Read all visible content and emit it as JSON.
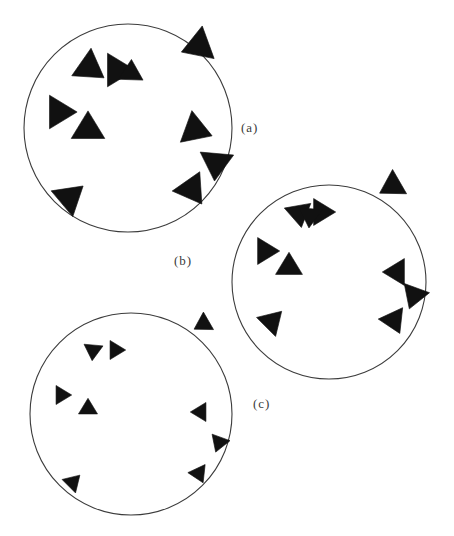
{
  "figure": {
    "title": "",
    "background_color": "#ffffff",
    "ink_color": "#111111",
    "circle_stroke_color": "#3c3c3c",
    "width": 454,
    "height": 536
  },
  "labels": {
    "panel_a": "(a)",
    "panel_b": "(b)",
    "panel_c": "(c)"
  },
  "chart_data": {
    "type": "scatter",
    "title": "",
    "xlabel": "",
    "ylabel": "",
    "panels": [
      {
        "id": "a",
        "label": "(a)",
        "circle": {
          "cx": 128,
          "cy": 128,
          "r": 104
        },
        "triangle_size": 30,
        "agent_count": 10,
        "agents": [
          {
            "x": 90,
            "y": 68,
            "heading_deg": 35,
            "size": 30
          },
          {
            "x": 118,
            "y": 70,
            "heading_deg": 0,
            "size": 30
          },
          {
            "x": 60,
            "y": 112,
            "heading_deg": 0,
            "size": 30
          },
          {
            "x": 88,
            "y": 128,
            "heading_deg": -90,
            "size": 30
          },
          {
            "x": 198,
            "y": 46,
            "heading_deg": 160,
            "size": 31
          },
          {
            "x": 196,
            "y": 130,
            "heading_deg": 20,
            "size": 30
          },
          {
            "x": 216,
            "y": 164,
            "heading_deg": 95,
            "size": 30
          },
          {
            "x": 192,
            "y": 190,
            "heading_deg": 55,
            "size": 30
          },
          {
            "x": 70,
            "y": 197,
            "heading_deg": -40,
            "size": 30
          },
          {
            "x": 131,
            "y": 72,
            "heading_deg": -88,
            "size": 22
          }
        ]
      },
      {
        "id": "b",
        "label": "(b)",
        "circle": {
          "cx": 329,
          "cy": 282,
          "r": 97
        },
        "triangle_size": 24,
        "agent_count": 10,
        "agents": [
          {
            "x": 299,
            "y": 214,
            "heading_deg": 80,
            "size": 24
          },
          {
            "x": 322,
            "y": 212,
            "heading_deg": 0,
            "size": 24
          },
          {
            "x": 266,
            "y": 251,
            "heading_deg": 0,
            "size": 24
          },
          {
            "x": 289,
            "y": 266,
            "heading_deg": -90,
            "size": 24
          },
          {
            "x": 392,
            "y": 186,
            "heading_deg": 150,
            "size": 25
          },
          {
            "x": 396,
            "y": 272,
            "heading_deg": 180,
            "size": 24
          },
          {
            "x": 414,
            "y": 296,
            "heading_deg": 110,
            "size": 24
          },
          {
            "x": 394,
            "y": 321,
            "heading_deg": 65,
            "size": 24
          },
          {
            "x": 272,
            "y": 321,
            "heading_deg": -45,
            "size": 24
          },
          {
            "x": 310,
            "y": 216,
            "heading_deg": 95,
            "size": 21
          }
        ]
      },
      {
        "id": "c",
        "label": "(c)",
        "circle": {
          "cx": 131,
          "cy": 414,
          "r": 101
        },
        "triangle_size": 17,
        "agent_count": 10,
        "agents": [
          {
            "x": 93,
            "y": 351,
            "heading_deg": 95,
            "size": 17
          },
          {
            "x": 116,
            "y": 350,
            "heading_deg": 0,
            "size": 17
          },
          {
            "x": 62,
            "y": 395,
            "heading_deg": 0,
            "size": 17
          },
          {
            "x": 88,
            "y": 408,
            "heading_deg": -90,
            "size": 17
          },
          {
            "x": 203,
            "y": 324,
            "heading_deg": 150,
            "size": 18
          },
          {
            "x": 200,
            "y": 412,
            "heading_deg": 180,
            "size": 17
          },
          {
            "x": 219,
            "y": 443,
            "heading_deg": 110,
            "size": 17
          },
          {
            "x": 199,
            "y": 474,
            "heading_deg": 65,
            "size": 17
          },
          {
            "x": 73,
            "y": 482,
            "heading_deg": -45,
            "size": 17
          }
        ]
      }
    ]
  }
}
